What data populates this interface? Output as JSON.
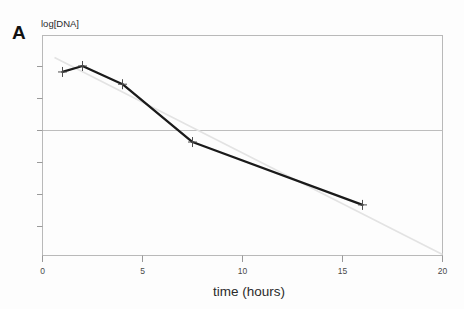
{
  "figure": {
    "panel_label": "A",
    "background_color": "#fdfdfd"
  },
  "chart_data": {
    "type": "line",
    "title": "",
    "subtitle": "",
    "xlabel": "time (hours)",
    "ylabel": "log[DNA]",
    "xlim": [
      0,
      20
    ],
    "ylim": [
      0,
      7
    ],
    "xticks": [
      0,
      5,
      10,
      15,
      20
    ],
    "xticklabels": [
      "0",
      "5",
      "10",
      "15",
      "20"
    ],
    "yticks": [
      1,
      2,
      3,
      4,
      5,
      6
    ],
    "yticklabels": [
      "",
      "",
      "",
      "",
      "",
      ""
    ],
    "grid": "horizontal-single",
    "gridline_y": 4,
    "legend": "none",
    "series": [
      {
        "name": "log[DNA] measured",
        "color": "#1a1a1a",
        "marker": "plus-error-bar",
        "linewidth": 2.2,
        "x": [
          1,
          2,
          4,
          7.5,
          16
        ],
        "y": [
          5.84,
          6.03,
          5.45,
          3.61,
          1.61
        ]
      },
      {
        "name": "linear fit (extrapolated)",
        "color": "#e2e2e2",
        "style": "dashed-faint",
        "linewidth": 1.4,
        "x": [
          0.6,
          20
        ],
        "y": [
          6.3,
          0.03
        ]
      }
    ],
    "annotations": []
  },
  "axes": {
    "frame_color": "#b9b9b9",
    "tick_color": "#9a9a9a",
    "gridline_color": "#bdbdbd"
  }
}
